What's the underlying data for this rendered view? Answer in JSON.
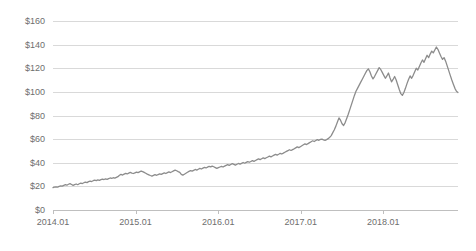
{
  "chart_data": {
    "type": "line",
    "title": "",
    "xlabel": "",
    "ylabel": "",
    "ylim": [
      0,
      160
    ],
    "ytick_values": [
      0,
      20,
      40,
      60,
      80,
      100,
      120,
      140,
      160
    ],
    "ytick_labels": [
      "$0",
      "$20",
      "$40",
      "$60",
      "$80",
      "$100",
      "$120",
      "$140",
      "$160"
    ],
    "xtick_labels": [
      "2014.01",
      "2015.01",
      "2016.01",
      "2017.01",
      "2018.01"
    ],
    "xtick_positions": [
      0,
      52,
      104,
      156,
      208
    ],
    "x_range": [
      0,
      255
    ],
    "grid": "horizontal",
    "legend": "none",
    "series": [
      {
        "name": "price",
        "color": "#8c8c8c",
        "units": "USD",
        "x_label_note": "weekly observations from 2014.01 to 2018.11",
        "values": [
          19.0,
          19.3,
          19.6,
          19.4,
          20.0,
          20.4,
          20.2,
          20.9,
          21.4,
          21.0,
          21.8,
          22.3,
          21.6,
          20.9,
          21.5,
          22.0,
          21.4,
          22.2,
          22.8,
          22.4,
          23.1,
          23.6,
          23.2,
          24.0,
          24.5,
          24.1,
          24.8,
          25.3,
          24.9,
          25.5,
          25.1,
          25.7,
          26.2,
          25.8,
          26.4,
          26.0,
          26.6,
          27.1,
          26.7,
          27.3,
          27.0,
          27.6,
          28.2,
          29.4,
          30.1,
          29.6,
          30.4,
          31.0,
          30.5,
          31.2,
          31.8,
          31.3,
          30.9,
          31.5,
          32.1,
          31.6,
          32.3,
          33.0,
          32.5,
          31.8,
          31.1,
          30.4,
          29.8,
          29.2,
          28.7,
          29.3,
          29.9,
          29.4,
          30.0,
          30.6,
          30.1,
          30.8,
          31.4,
          30.9,
          31.6,
          32.2,
          31.7,
          32.4,
          33.1,
          33.8,
          33.2,
          32.5,
          31.9,
          30.2,
          29.5,
          30.3,
          31.1,
          31.9,
          32.7,
          33.4,
          32.9,
          33.6,
          34.3,
          33.8,
          34.5,
          35.2,
          34.7,
          35.4,
          36.1,
          35.6,
          36.3,
          37.0,
          36.5,
          37.2,
          36.6,
          35.9,
          35.2,
          35.8,
          36.4,
          37.0,
          36.4,
          37.1,
          37.8,
          38.4,
          37.8,
          38.5,
          39.2,
          38.6,
          38.0,
          38.7,
          39.4,
          38.8,
          39.5,
          40.2,
          39.6,
          40.3,
          41.0,
          40.4,
          41.1,
          41.8,
          41.2,
          41.9,
          42.6,
          43.3,
          42.7,
          43.4,
          44.1,
          43.5,
          44.2,
          44.9,
          45.6,
          45.0,
          45.7,
          46.4,
          47.1,
          46.5,
          47.2,
          48.0,
          47.4,
          48.1,
          48.9,
          49.6,
          50.3,
          51.0,
          50.4,
          51.1,
          51.8,
          52.6,
          53.4,
          52.8,
          53.6,
          54.4,
          55.2,
          56.0,
          55.4,
          56.2,
          57.0,
          57.8,
          58.6,
          58.0,
          58.8,
          59.6,
          59.0,
          59.8,
          60.0,
          59.4,
          59.0,
          59.6,
          60.4,
          61.5,
          63.0,
          65.5,
          68.0,
          71.0,
          74.5,
          78.0,
          76.0,
          73.0,
          71.5,
          74.0,
          77.5,
          81.0,
          85.0,
          89.0,
          93.0,
          97.0,
          100.5,
          103.0,
          105.5,
          108.0,
          110.5,
          113.0,
          115.5,
          118.0,
          119.5,
          117.0,
          113.5,
          111.0,
          113.0,
          115.5,
          118.0,
          120.5,
          119.0,
          116.5,
          114.0,
          111.5,
          113.5,
          116.0,
          112.0,
          108.5,
          110.5,
          113.0,
          110.0,
          106.0,
          102.0,
          98.5,
          97.0,
          99.5,
          103.0,
          107.0,
          110.5,
          113.5,
          111.5,
          114.0,
          117.0,
          120.0,
          118.5,
          121.5,
          124.5,
          127.0,
          125.0,
          128.0,
          131.0,
          129.0,
          132.0,
          134.5,
          133.0,
          135.5,
          138.0,
          136.0,
          133.0,
          130.0,
          127.5,
          129.0,
          126.0,
          122.0,
          118.0,
          114.0,
          110.0,
          106.5,
          103.0,
          100.5,
          99.5
        ]
      }
    ]
  },
  "axes": {
    "y_axis_name": "price-axis",
    "x_axis_name": "date-axis"
  }
}
